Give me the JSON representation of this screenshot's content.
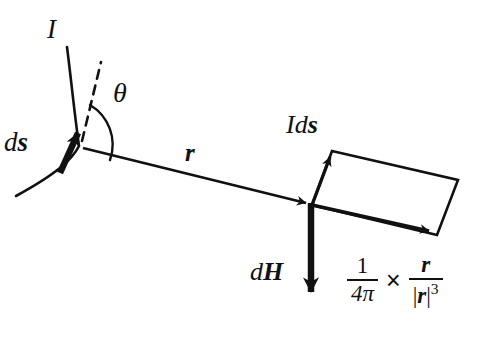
{
  "figure": {
    "background_color": "#ffffff",
    "ink_color": "#111111"
  },
  "labels": {
    "current": "I",
    "angle": "θ",
    "source_element": {
      "italic_part": "d",
      "bold_part": "s"
    },
    "distance_vector": "r",
    "current_element": {
      "current": "I",
      "italic_part": "d",
      "bold_part": "s"
    },
    "field_element": {
      "italic_part": "d",
      "bold_part": "H"
    }
  },
  "formula": {
    "first_fraction": {
      "numerator": "1",
      "denominator": "4π"
    },
    "operator": "×",
    "second_fraction": {
      "numerator": "r",
      "denominator_bar_open": "|",
      "denominator_vector": "r",
      "denominator_bar_close": "|",
      "denominator_exponent": "3"
    }
  },
  "elements": {
    "wire_curve": "current-carrying-wire",
    "ds_arrow": "ds-tangent-arrow",
    "dashed_tangent": "tangent-extension-dashed-line",
    "theta_arc": "angle-theta-arc",
    "r_vector": "r-displacement-vector",
    "Ids_vector": "Ids-current-element-vector",
    "r_hat_vector": "r-direction-vector",
    "parallelogram": "cross-product-parallelogram",
    "dH_arrow": "dH-field-vector"
  }
}
